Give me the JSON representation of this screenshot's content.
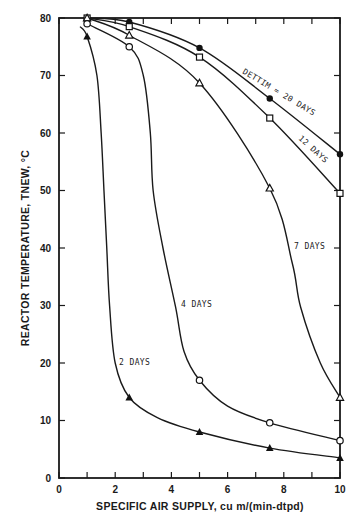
{
  "chart_data": {
    "type": "line",
    "title": "",
    "xlabel": "SPECIFIC AIR SUPPLY, cu m/(min-dtpd)",
    "ylabel": "REACTOR TEMPERATURE, TNEW, °C",
    "xlim": [
      0,
      10
    ],
    "ylim": [
      0,
      80
    ],
    "xticks": [
      0,
      2,
      4,
      6,
      8,
      10
    ],
    "yticks": [
      0,
      10,
      20,
      30,
      40,
      50,
      60,
      70,
      80
    ],
    "x_minor_step": 1,
    "grid": false,
    "legend": "inline curve labels",
    "x": [
      1,
      2.5,
      5,
      7.5,
      10
    ],
    "series": [
      {
        "name": "DETTIM = 20 DAYS",
        "marker": "filled-circle",
        "values": [
          80,
          79.3,
          74.8,
          66,
          56.3
        ]
      },
      {
        "name": "12 DAYS",
        "marker": "open-square",
        "values": [
          80,
          78.5,
          73.2,
          62.6,
          49.5
        ]
      },
      {
        "name": "7 DAYS",
        "marker": "open-triangle",
        "values": [
          80,
          77,
          68.7,
          50.4,
          14
        ]
      },
      {
        "name": "4 DAYS",
        "marker": "open-circle",
        "values": [
          79,
          75,
          17,
          9.6,
          6.5
        ]
      },
      {
        "name": "2 DAYS",
        "marker": "filled-triangle",
        "values": [
          76.8,
          14,
          8,
          5.2,
          3.5
        ]
      }
    ]
  },
  "render": {
    "plot": {
      "x0": 59,
      "x1": 340,
      "y0": 478,
      "y1": 18
    },
    "curves": [
      {
        "id": "20",
        "path_points": [
          [
            1,
            80
          ],
          [
            2.5,
            79.3
          ],
          [
            5,
            74.8
          ],
          [
            7.5,
            66
          ],
          [
            10,
            56.3
          ]
        ]
      },
      {
        "id": "12",
        "path_points": [
          [
            1,
            80
          ],
          [
            2.5,
            78.5
          ],
          [
            5,
            73.2
          ],
          [
            7.5,
            62.6
          ],
          [
            10,
            49.5
          ]
        ]
      },
      {
        "id": "7",
        "path_points": [
          [
            1,
            80
          ],
          [
            2.5,
            77
          ],
          [
            5,
            68.7
          ],
          [
            7.5,
            50.4
          ],
          [
            8.3,
            37.4
          ],
          [
            8.6,
            29.7
          ],
          [
            9.3,
            20
          ],
          [
            10,
            14
          ]
        ]
      },
      {
        "id": "4",
        "path_points": [
          [
            1,
            79
          ],
          [
            2.5,
            75
          ],
          [
            3.0,
            70
          ],
          [
            3.25,
            60
          ],
          [
            3.35,
            50
          ],
          [
            3.7,
            40
          ],
          [
            4.15,
            29.7
          ],
          [
            4.45,
            22
          ],
          [
            5,
            17
          ],
          [
            6,
            12.5
          ],
          [
            7.5,
            9.6
          ],
          [
            10,
            6.5
          ]
        ]
      },
      {
        "id": "2",
        "path_points": [
          [
            0.75,
            78.5
          ],
          [
            1,
            76.8
          ],
          [
            1.35,
            70
          ],
          [
            1.5,
            60
          ],
          [
            1.6,
            50
          ],
          [
            1.7,
            40
          ],
          [
            1.8,
            30
          ],
          [
            2.0,
            20
          ],
          [
            2.5,
            14
          ],
          [
            3.5,
            10.5
          ],
          [
            5,
            8
          ],
          [
            7.5,
            5.2
          ],
          [
            10,
            3.5
          ]
        ]
      }
    ],
    "labels": [
      {
        "text": "DETTIM = 20 DAYS",
        "x": 242,
        "y": 73,
        "rotate": 31
      },
      {
        "text": "12 DAYS",
        "x": 298,
        "y": 139,
        "rotate": 42
      },
      {
        "text": "7 DAYS",
        "x": 294,
        "y": 249,
        "rotate": 0
      },
      {
        "text": "4 DAYS",
        "x": 181,
        "y": 307,
        "rotate": 0
      },
      {
        "text": "2 DAYS",
        "x": 119,
        "y": 365,
        "rotate": 0
      }
    ]
  }
}
